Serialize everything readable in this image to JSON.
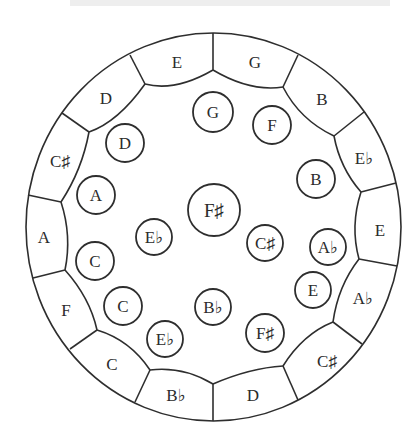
{
  "figure": {
    "outer_ring": {
      "segments": [
        {
          "label": "E",
          "x": 177,
          "y": 62
        },
        {
          "label": "G",
          "x": 255,
          "y": 62
        },
        {
          "label": "B",
          "x": 322,
          "y": 99
        },
        {
          "label": "E♭",
          "x": 364,
          "y": 158
        },
        {
          "label": "E",
          "x": 380,
          "y": 230
        },
        {
          "label": "A♭",
          "x": 363,
          "y": 298
        },
        {
          "label": "C♯",
          "x": 327,
          "y": 361
        },
        {
          "label": "D",
          "x": 253,
          "y": 395
        },
        {
          "label": "B♭",
          "x": 176,
          "y": 395
        },
        {
          "label": "C",
          "x": 112,
          "y": 364
        },
        {
          "label": "F",
          "x": 66,
          "y": 310
        },
        {
          "label": "A",
          "x": 44,
          "y": 237
        },
        {
          "label": "C♯",
          "x": 60,
          "y": 161
        },
        {
          "label": "D",
          "x": 106,
          "y": 98
        }
      ]
    },
    "inner_notes": [
      {
        "label": "G",
        "x": 213,
        "y": 112,
        "r": 20
      },
      {
        "label": "F",
        "x": 272,
        "y": 125,
        "r": 19
      },
      {
        "label": "D",
        "x": 125,
        "y": 143,
        "r": 19
      },
      {
        "label": "B",
        "x": 316,
        "y": 179,
        "r": 19
      },
      {
        "label": "A",
        "x": 96,
        "y": 195,
        "r": 19
      },
      {
        "label": "F♯",
        "x": 214,
        "y": 210,
        "r": 26
      },
      {
        "label": "E♭",
        "x": 154,
        "y": 237,
        "r": 18
      },
      {
        "label": "C♯",
        "x": 265,
        "y": 243,
        "r": 18
      },
      {
        "label": "A♭",
        "x": 328,
        "y": 247,
        "r": 18
      },
      {
        "label": "C",
        "x": 95,
        "y": 261,
        "r": 19
      },
      {
        "label": "E",
        "x": 313,
        "y": 290,
        "r": 18
      },
      {
        "label": "C",
        "x": 123,
        "y": 306,
        "r": 19
      },
      {
        "label": "B♭",
        "x": 213,
        "y": 307,
        "r": 18
      },
      {
        "label": "F♯",
        "x": 265,
        "y": 333,
        "r": 19
      },
      {
        "label": "E♭",
        "x": 165,
        "y": 339,
        "r": 18
      }
    ],
    "colors": {
      "line": "#2e2e2e",
      "text": "#2b2b2b",
      "background": "#ffffff"
    }
  }
}
